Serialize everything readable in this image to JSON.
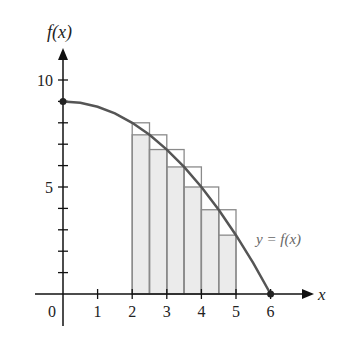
{
  "chart_data": {
    "type": "area",
    "title": "",
    "function": "f(x) = 9 - x^2/4",
    "xlabel": "x",
    "ylabel": "f(x)",
    "curve_label": "y = f(x)",
    "xlim": [
      0,
      6
    ],
    "ylim": [
      0,
      10
    ],
    "x_ticks": [
      0,
      1,
      2,
      3,
      4,
      5,
      6
    ],
    "x_tick_labels": [
      "0",
      "1",
      "2",
      "3",
      "4",
      "5",
      "6"
    ],
    "y_ticks": [
      1,
      2,
      3,
      4,
      5,
      6,
      7,
      8,
      9,
      10
    ],
    "y_tick_labels": {
      "5": "5",
      "10": "10"
    },
    "grid": false,
    "curve_points": [
      {
        "x": 0,
        "y": 9
      },
      {
        "x": 0.5,
        "y": 8.9375
      },
      {
        "x": 1,
        "y": 8.75
      },
      {
        "x": 1.5,
        "y": 8.4375
      },
      {
        "x": 2,
        "y": 8
      },
      {
        "x": 2.5,
        "y": 7.4375
      },
      {
        "x": 3,
        "y": 6.75
      },
      {
        "x": 3.5,
        "y": 5.9375
      },
      {
        "x": 4,
        "y": 5
      },
      {
        "x": 4.5,
        "y": 3.9375
      },
      {
        "x": 5,
        "y": 2.75
      },
      {
        "x": 5.5,
        "y": 1.4375
      },
      {
        "x": 6,
        "y": 0
      }
    ],
    "series": [
      {
        "name": "upper rectangles (left endpoints, outline)",
        "x_left": [
          2,
          2.5,
          3,
          3.5,
          4,
          4.5
        ],
        "width": 0.5,
        "values": [
          8,
          7.4375,
          6.75,
          5.9375,
          5,
          3.9375
        ]
      },
      {
        "name": "lower rectangles (right endpoints, shaded)",
        "x_left": [
          2,
          2.5,
          3,
          3.5,
          4,
          4.5
        ],
        "width": 0.5,
        "values": [
          7.4375,
          6.75,
          5.9375,
          5,
          3.9375,
          2.75
        ]
      }
    ],
    "markers": [
      {
        "x": 0,
        "y": 9
      },
      {
        "x": 6,
        "y": 0
      }
    ],
    "colors": {
      "fill": "#ebebeb",
      "rect_stroke": "#8a8a8a",
      "curve": "#555555",
      "axis": "#111111",
      "curve_label": "#666666"
    }
  }
}
